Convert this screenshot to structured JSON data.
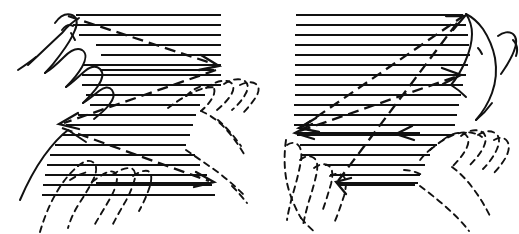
{
  "figure": {
    "description": "Line drawing of two panels. Each panel shows hands over a block of horizontal text lines with dashed arrows tracing the reading sweep path.",
    "background_color": "#ffffff",
    "ink_color": "#111111",
    "width": 519,
    "height": 234,
    "panel_count": 2
  },
  "panels": [
    {
      "id": "panel-left",
      "label": "Left panel",
      "name": "scanning-pattern-left",
      "hand_style_primary": "solid-outline",
      "hand_style_secondary": "dashed-outline",
      "text_block": {
        "line_count": 21,
        "top_y": 14,
        "line_spacing": 10,
        "left_x": 74,
        "right_x": 221
      },
      "arrow_paths": [
        {
          "name": "sweep-1",
          "from": [
            66,
            16
          ],
          "to": [
            218,
            66
          ],
          "direction": "right-down",
          "head": "right"
        },
        {
          "name": "sweep-2",
          "from": [
            216,
            70
          ],
          "to": [
            60,
            124
          ],
          "direction": "left-down",
          "head": "left"
        },
        {
          "name": "sweep-3",
          "from": [
            60,
            128
          ],
          "to": [
            213,
            183
          ],
          "direction": "right-down",
          "head": "right"
        }
      ],
      "arrow_count": 3
    },
    {
      "id": "panel-right",
      "label": "Right panel",
      "name": "scanning-pattern-right",
      "hand_style_primary": "solid-outline",
      "hand_style_secondary": "dashed-outline",
      "text_block": {
        "line_count": 21,
        "top_y": 14,
        "line_spacing": 10,
        "left_x": 294,
        "right_x": 466
      },
      "arrow_paths": [
        {
          "name": "sweep-1",
          "from": [
            300,
            128
          ],
          "to": [
            464,
            16
          ],
          "direction": "right-up",
          "head": "both"
        },
        {
          "name": "sweep-2",
          "from": [
            298,
            126
          ],
          "to": [
            460,
            74
          ],
          "direction": "right-up",
          "head": "right"
        },
        {
          "name": "sweep-3",
          "from": [
            336,
            180
          ],
          "to": [
            462,
            18
          ],
          "direction": "right-up",
          "head": "left"
        }
      ],
      "arrow_count": 3
    }
  ],
  "legend": {
    "solid_hand_meaning": "hand shown in starting position",
    "dashed_hand_meaning": "hand shown in ending position",
    "arrow_meaning": "direction of finger movement across the lines"
  }
}
